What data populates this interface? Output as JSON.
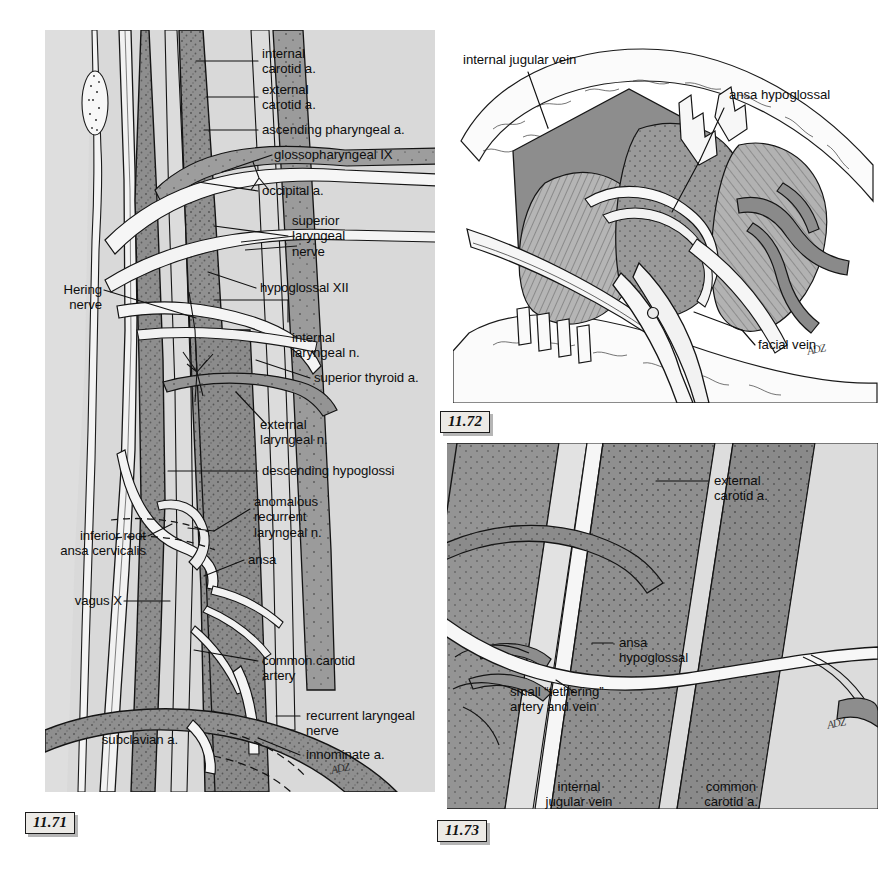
{
  "page": {
    "background": "#ffffff",
    "panel_background": "#d9d9d9",
    "ink": "#101010",
    "vessel_mid": "#9a9a9a",
    "vessel_dark": "#808080",
    "vessel_light": "#c4c4c4",
    "highlight": "#f2f2f2"
  },
  "figures": [
    {
      "id": "11.71",
      "number": "11.71",
      "caption_text": "11.71",
      "labels": [
        {
          "key": "internal_carotid",
          "text": "internal\ncarotid a."
        },
        {
          "key": "external_carotid",
          "text": "external\ncarotid a."
        },
        {
          "key": "ascending_pharyngeal",
          "text": "ascending pharyngeal a."
        },
        {
          "key": "glossopharyngeal",
          "text": "glossopharyngeal IX"
        },
        {
          "key": "occipital",
          "text": "occipital a."
        },
        {
          "key": "superior_laryngeal_nerve",
          "text": "superior\nlaryngeal\nnerve"
        },
        {
          "key": "hypoglossal",
          "text": "hypoglossal XII"
        },
        {
          "key": "internal_laryngeal_n",
          "text": "internal\nlaryngeal n."
        },
        {
          "key": "superior_thyroid",
          "text": "superior thyroid a."
        },
        {
          "key": "external_laryngeal_n",
          "text": "external\nlaryngeal n."
        },
        {
          "key": "descending_hypoglossi",
          "text": "descending hypoglossi"
        },
        {
          "key": "anomalous_recurrent",
          "text": "anomalous\nrecurrent\nlaryngeal n."
        },
        {
          "key": "ansa",
          "text": "ansa"
        },
        {
          "key": "hering_nerve",
          "text": "Hering\nnerve"
        },
        {
          "key": "inferior_root_ansa",
          "text": "inferior root\nansa cervicalis"
        },
        {
          "key": "vagus",
          "text": "vagus X"
        },
        {
          "key": "common_carotid",
          "text": "common carotid\nartery"
        },
        {
          "key": "recurrent_laryngeal",
          "text": "recurrent laryngeal\nnerve"
        },
        {
          "key": "innominate",
          "text": "innominate a."
        },
        {
          "key": "subclavian",
          "text": "subclavian a."
        }
      ],
      "signature": "artist-signature"
    },
    {
      "id": "11.72",
      "number": "11.72",
      "caption_text": "11.72",
      "labels": [
        {
          "key": "internal_jugular_vein",
          "text": "internal jugular vein"
        },
        {
          "key": "ansa_hypoglossal",
          "text": "ansa hypoglossal"
        },
        {
          "key": "facial_vein",
          "text": "facial vein"
        }
      ],
      "signature": "artist-signature"
    },
    {
      "id": "11.73",
      "number": "11.73",
      "caption_text": "11.73",
      "labels": [
        {
          "key": "external_carotid",
          "text": "external\ncarotid a."
        },
        {
          "key": "ansa_hypoglossal",
          "text": "ansa\nhypoglossal"
        },
        {
          "key": "tethering_vessels",
          "text": "small “tethering”\nartery and vein"
        },
        {
          "key": "internal_jugular",
          "text": "internal\njugular vein"
        },
        {
          "key": "common_carotid",
          "text": "common\ncarotid a."
        }
      ],
      "signature": "artist-signature"
    }
  ],
  "fig71_labels": {
    "internal_carotid": "internal\ncarotid a.",
    "external_carotid": "external\ncarotid a.",
    "ascending_pharyngeal": "ascending pharyngeal a.",
    "glossopharyngeal": "glossopharyngeal IX",
    "occipital": "occipital a.",
    "superior_laryngeal_nerve": "superior\nlaryngeal\nnerve",
    "hypoglossal": "hypoglossal XII",
    "internal_laryngeal_n": "internal\nlaryngeal n.",
    "superior_thyroid": "superior thyroid a.",
    "external_laryngeal_n": "external\nlaryngeal n.",
    "descending_hypoglossi": "descending hypoglossi",
    "anomalous_recurrent": "anomalous\nrecurrent\nlaryngeal n.",
    "ansa": "ansa",
    "hering_nerve": "Hering\nnerve",
    "inferior_root_ansa": "inferior root\nansa cervicalis",
    "vagus": "vagus X",
    "common_carotid": "common carotid\nartery",
    "recurrent_laryngeal": "recurrent laryngeal\nnerve",
    "innominate": "innominate a.",
    "subclavian": "subclavian a."
  },
  "fig72_labels": {
    "internal_jugular_vein": "internal jugular vein",
    "ansa_hypoglossal": "ansa hypoglossal",
    "facial_vein": "facial vein"
  },
  "fig73_labels": {
    "external_carotid": "external\ncarotid a.",
    "ansa_hypoglossal": "ansa\nhypoglossal",
    "tethering_vessels": "small “tethering”\nartery and vein",
    "internal_jugular": "internal\njugular vein",
    "common_carotid": "common\ncarotid a."
  },
  "fignums": {
    "f71": "11.71",
    "f72": "11.72",
    "f73": "11.73"
  }
}
